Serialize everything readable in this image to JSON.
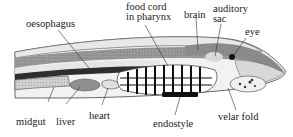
{
  "diagram": {
    "labels": {
      "oesophagus": "oesophagus",
      "food_cord_line1": "food cord",
      "food_cord_line2": "in pharynx",
      "brain": "brain",
      "auditory_line1": "auditory",
      "auditory_line2": "sac",
      "eye": "eye",
      "midgut": "midgut",
      "liver": "liver",
      "heart": "heart",
      "endostyle": "endostyle",
      "velar_fold": "velar fold"
    },
    "colors": {
      "ink": "#222222",
      "dark_band": "#3a3a3a",
      "mid_gray": "#8c8c8c",
      "light_gray": "#c8c8c8",
      "paper": "#ffffff"
    }
  }
}
